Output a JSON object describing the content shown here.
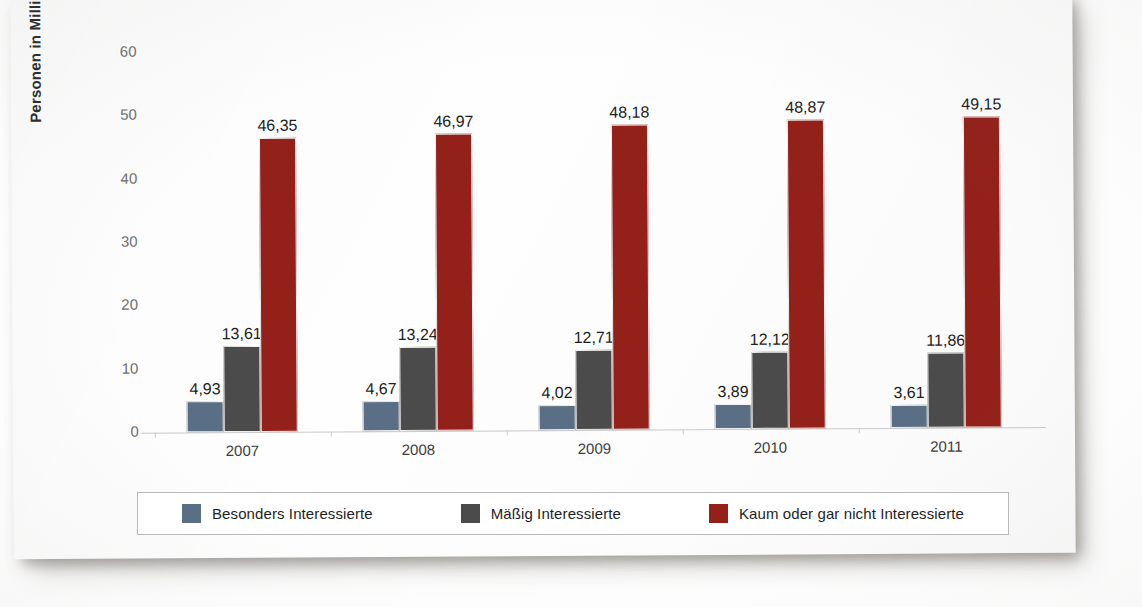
{
  "chart_data": {
    "type": "bar",
    "title": "",
    "xlabel": "",
    "ylabel": "Personen in Millionen",
    "ylim": [
      0,
      60
    ],
    "yticks": [
      "0",
      "10",
      "20",
      "30",
      "40",
      "50",
      "60"
    ],
    "grid": false,
    "legend_position": "bottom",
    "categories": [
      "2007",
      "2008",
      "2009",
      "2010",
      "2011"
    ],
    "series": [
      {
        "name": "Besonders Interessierte",
        "color": "#5a6e85",
        "values": [
          4.93,
          4.67,
          4.02,
          3.89,
          3.61
        ],
        "labels": [
          "4,93",
          "4,67",
          "4,02",
          "3,89",
          "3,61"
        ]
      },
      {
        "name": "Mäßig Interessierte",
        "color": "#4b4b4b",
        "values": [
          13.61,
          13.24,
          12.71,
          12.12,
          11.86
        ],
        "labels": [
          "13,61",
          "13,24",
          "12,71",
          "12,12",
          "11,86"
        ]
      },
      {
        "name": "Kaum oder gar nicht Interessierte",
        "color": "#93211a",
        "values": [
          46.35,
          46.97,
          48.18,
          48.87,
          49.15
        ],
        "labels": [
          "46,35",
          "46,97",
          "48,18",
          "48,87",
          "49,15"
        ]
      }
    ]
  },
  "legend": {
    "items": [
      {
        "label": "Besonders Interessierte",
        "color": "#5a6e85"
      },
      {
        "label": "Mäßig Interessierte",
        "color": "#4b4b4b"
      },
      {
        "label": "Kaum oder gar nicht Interessierte",
        "color": "#93211a"
      }
    ]
  },
  "axes": {
    "y_title": "Personen in Millionen",
    "y_ticks": [
      "60",
      "50",
      "40",
      "30",
      "20",
      "10",
      "0"
    ],
    "x_ticks": [
      "2007",
      "2008",
      "2009",
      "2010",
      "2011"
    ]
  }
}
